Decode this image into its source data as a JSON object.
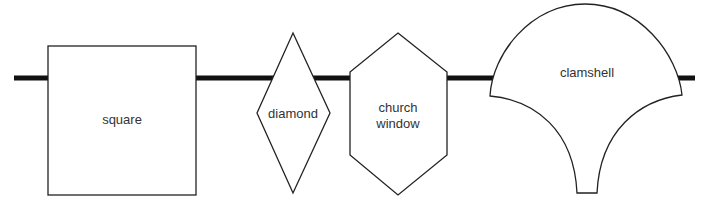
{
  "diagram": {
    "line_color": "#111111",
    "stroke_color": "#222222",
    "shapes": [
      {
        "id": "square",
        "label_lines": [
          "square"
        ]
      },
      {
        "id": "diamond",
        "label_lines": [
          "diamond"
        ]
      },
      {
        "id": "church-window",
        "label_lines": [
          "church",
          "window"
        ]
      },
      {
        "id": "clamshell",
        "label_lines": [
          "clamshell"
        ]
      }
    ]
  }
}
